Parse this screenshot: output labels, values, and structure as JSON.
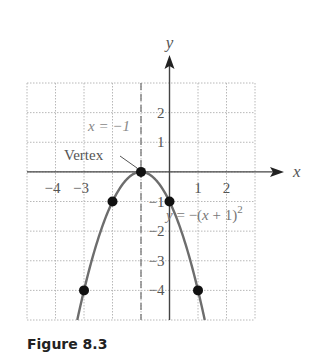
{
  "chart_data": {
    "type": "line",
    "title": "",
    "equation": "y = −(x + 1)²",
    "axis_of_symmetry_label": "x = −1",
    "vertex_label": "Vertex",
    "xlabel": "x",
    "ylabel": "y",
    "xlim": [
      -5,
      3
    ],
    "ylim": [
      -5,
      3
    ],
    "grid": true,
    "x_tick_labels": [
      "−4",
      "−3",
      "1",
      "2"
    ],
    "x_ticks": [
      -4,
      -3,
      1,
      2
    ],
    "y_tick_labels": [
      "2",
      "1",
      "−1",
      "−2",
      "−3",
      "−4"
    ],
    "y_ticks": [
      2,
      1,
      -1,
      -2,
      -3,
      -4
    ],
    "series": [
      {
        "name": "y = −(x + 1)²",
        "function": "-(x+1)^2",
        "color": "#6d6d6d"
      }
    ],
    "points": [
      {
        "x": -1,
        "y": 0,
        "label": "Vertex"
      },
      {
        "x": -2,
        "y": -1
      },
      {
        "x": 0,
        "y": -1
      },
      {
        "x": -3,
        "y": -4
      },
      {
        "x": 1,
        "y": -4
      }
    ],
    "dashed_line": {
      "x": -1,
      "label": "x = −1"
    }
  },
  "caption": "Figure 8.3"
}
